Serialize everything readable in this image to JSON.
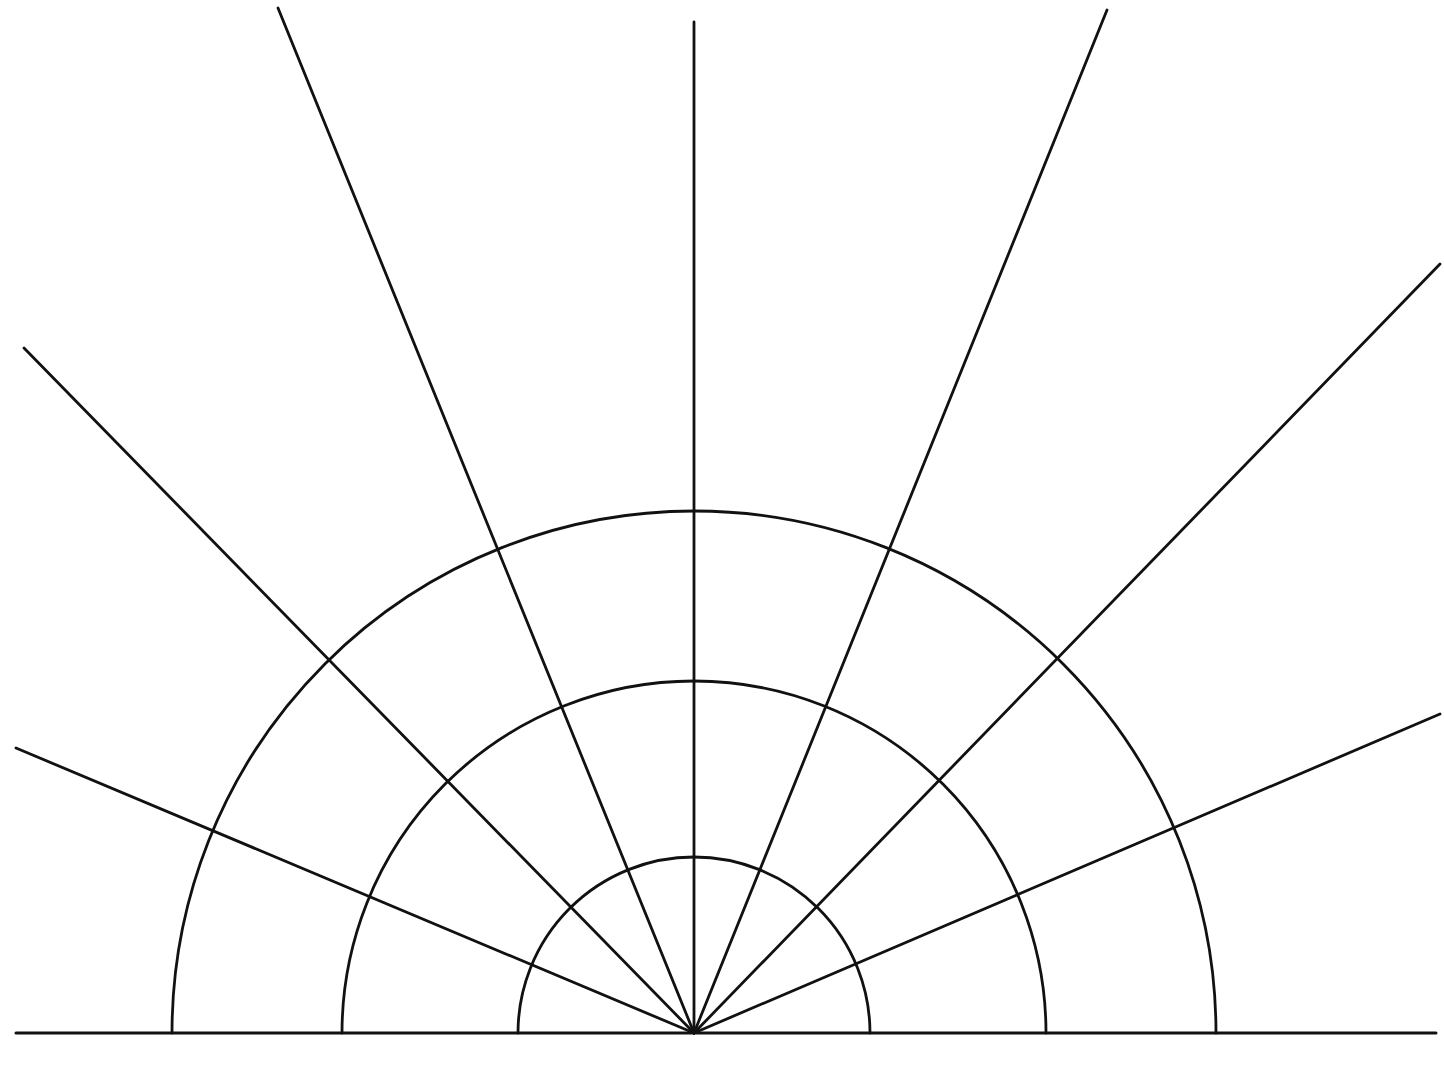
{
  "diagram": {
    "type": "polar-grid-semicircle",
    "stroke_color": "#111111",
    "background": "#ffffff",
    "origin": {
      "x": 694,
      "y": 1033
    },
    "baseline": {
      "x1": 16,
      "x2": 1436,
      "y": 1033
    },
    "arcs": [
      {
        "name": "inner",
        "radius": 176
      },
      {
        "name": "middle",
        "radius": 352
      },
      {
        "name": "outer",
        "radius": 522
      }
    ],
    "rays": [
      {
        "name": "ray-left-low",
        "x2": 16,
        "y2": 748
      },
      {
        "name": "ray-left-mid",
        "x2": 24,
        "y2": 348
      },
      {
        "name": "ray-left-high",
        "x2": 278,
        "y2": 8
      },
      {
        "name": "ray-vertical",
        "x2": 694,
        "y2": 22
      },
      {
        "name": "ray-right-high",
        "x2": 1107,
        "y2": 10
      },
      {
        "name": "ray-right-mid",
        "x2": 1440,
        "y2": 264
      },
      {
        "name": "ray-right-low",
        "x2": 1440,
        "y2": 714
      }
    ]
  }
}
